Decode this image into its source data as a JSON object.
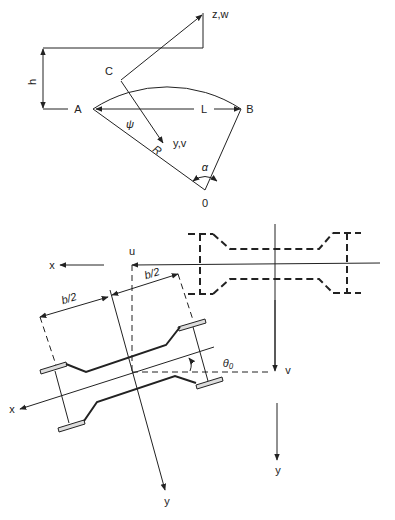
{
  "arch_diagram": {
    "points": {
      "A": "A",
      "B": "B",
      "C": "C",
      "O": "0"
    },
    "dimensions": {
      "span": "L",
      "rise": "h",
      "radius": "R"
    },
    "angles": {
      "central": "α",
      "position": "ψ"
    },
    "axes": {
      "tangent": "z,w",
      "normal": "y,v"
    }
  },
  "section_diagram": {
    "dimensions": {
      "half_width_left": "b/2",
      "half_width_right": "b/2"
    },
    "angle": "θ₀",
    "displacements": {
      "horizontal": "u",
      "vertical": "v"
    },
    "axes": {
      "global_x": "x",
      "global_y": "y",
      "local_x": "x",
      "local_y": "y"
    }
  }
}
